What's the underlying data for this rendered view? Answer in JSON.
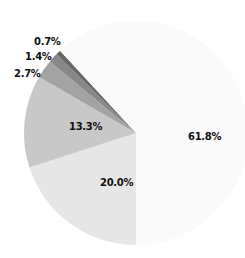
{
  "chart_data": {
    "type": "pie",
    "title": "",
    "start_angle_deg": 180,
    "direction": "clockwise",
    "slices": [
      {
        "label": "20.0%",
        "value": 20.0,
        "color": "#e6e6e6"
      },
      {
        "label": "13.3%",
        "value": 13.3,
        "color": "#c8c8c8"
      },
      {
        "label": "2.7%",
        "value": 2.7,
        "color": "#a3a3a3"
      },
      {
        "label": "1.4%",
        "value": 1.4,
        "color": "#888888"
      },
      {
        "label": "0.7%",
        "value": 0.7,
        "color": "#666666"
      },
      {
        "label": "61.8%",
        "value": 61.8,
        "color": "#fafafa"
      }
    ],
    "legend": null
  }
}
